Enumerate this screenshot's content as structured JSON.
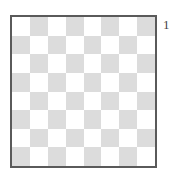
{
  "board": {
    "rows": 8,
    "cols": 8,
    "light_color": "#ffffff",
    "dark_color": "#dcdcdc",
    "border_color": "#5a5a5a",
    "top_left": "light"
  },
  "label": "1"
}
